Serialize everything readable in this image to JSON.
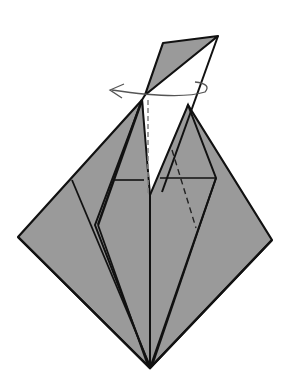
{
  "diagram": {
    "type": "origami-step",
    "colors": {
      "paper": "#9a9a9a",
      "line": "#111111",
      "background": "#ffffff",
      "arrow": "#555555"
    },
    "symbols": [
      "valley-fold-dashed-line",
      "turn-over-rotation-arrow"
    ]
  }
}
